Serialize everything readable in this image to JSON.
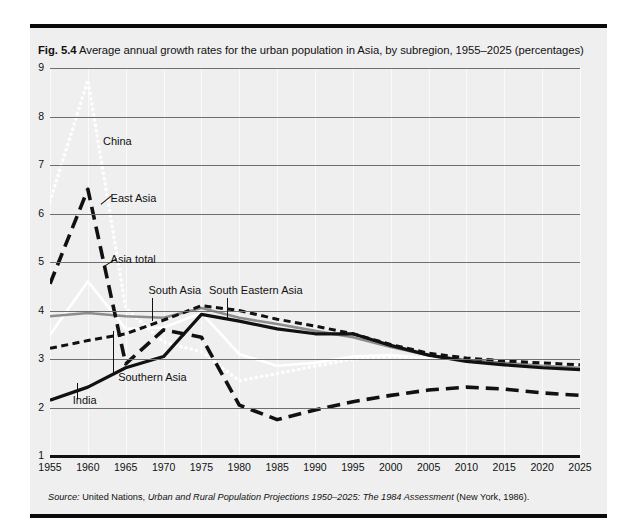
{
  "figure": {
    "number": "Fig. 5.4",
    "caption": "Average annual growth rates for the urban population in Asia, by subregion, 1955–2025 (percentages)",
    "source_label": "Source:",
    "source_org": "United Nations,",
    "source_title": "Urban and Rural Population Projections 1950–2025: The 1984 Assessment",
    "source_pub": "(New York, 1986)."
  },
  "chart_data": {
    "type": "line",
    "title": "Average annual growth rates for the urban population in Asia, by subregion, 1955–2025 (percentages)",
    "xlabel": "",
    "ylabel": "",
    "xlim": [
      1955,
      2025
    ],
    "ylim": [
      1,
      9
    ],
    "grid": true,
    "legend": "in-chart annotations",
    "x": [
      1955,
      1960,
      1965,
      1970,
      1975,
      1980,
      1985,
      1990,
      1995,
      2000,
      2005,
      2010,
      2015,
      2020,
      2025
    ],
    "xticklabels": [
      "1955",
      "1960",
      "1965",
      "1970",
      "1975",
      "1980",
      "1985",
      "1990",
      "1995",
      "2000",
      "2005",
      "2010",
      "2015",
      "2020",
      "2025"
    ],
    "yticks": [
      1,
      2,
      3,
      4,
      5,
      6,
      7,
      8,
      9
    ],
    "yticklabels": [
      "1",
      "2",
      "3",
      "4",
      "5",
      "6",
      "7",
      "8",
      "9"
    ],
    "series": [
      {
        "name": "China",
        "style": "dotted",
        "color": "#ffffff",
        "values": [
          6.25,
          8.75,
          4.05,
          3.35,
          3.15,
          2.55,
          2.7,
          2.85,
          3.0,
          3.05,
          3.02,
          2.98,
          2.95,
          2.9,
          2.86
        ]
      },
      {
        "name": "East Asia",
        "style": "long-dash",
        "color": "#111111",
        "values": [
          4.55,
          6.5,
          2.9,
          3.6,
          3.45,
          2.05,
          1.75,
          1.95,
          2.12,
          2.25,
          2.36,
          2.42,
          2.38,
          2.3,
          2.25
        ]
      },
      {
        "name": "Asia total",
        "style": "solid-gray",
        "color": "#8d8d8d",
        "values": [
          3.88,
          3.95,
          3.88,
          3.85,
          4.05,
          3.85,
          3.72,
          3.58,
          3.45,
          3.25,
          3.08,
          2.98,
          2.92,
          2.86,
          2.82
        ]
      },
      {
        "name": "South Asia",
        "style": "short-dash",
        "color": "#111111",
        "values": [
          3.22,
          3.38,
          3.52,
          3.8,
          4.1,
          4.0,
          3.82,
          3.68,
          3.52,
          3.3,
          3.12,
          3.02,
          2.96,
          2.92,
          2.88
        ]
      },
      {
        "name": "Southern Asia",
        "style": "solid-white",
        "color": "#ffffff",
        "values": [
          3.5,
          4.6,
          3.62,
          3.65,
          3.95,
          3.1,
          2.86,
          2.92,
          3.05,
          3.08,
          3.02,
          2.98,
          2.94,
          2.9,
          2.86
        ]
      },
      {
        "name": "India",
        "style": "solid-black",
        "color": "#111111",
        "values": [
          2.15,
          2.42,
          2.82,
          3.05,
          3.92,
          3.78,
          3.62,
          3.52,
          3.52,
          3.28,
          3.08,
          2.95,
          2.88,
          2.82,
          2.78
        ]
      }
    ],
    "annotations": [
      {
        "text": "China",
        "x": 1962,
        "y": 7.45,
        "leader": false
      },
      {
        "text": "East Asia",
        "x": 1963,
        "y": 6.28,
        "leader": true
      },
      {
        "text": "Asia total",
        "x": 1963,
        "y": 5.02,
        "leader": true
      },
      {
        "text": "South Asia",
        "x": 1968,
        "y": 4.38,
        "leader": true
      },
      {
        "text": "South Eastern Asia",
        "x": 1976,
        "y": 4.38,
        "leader": true
      },
      {
        "text": "Southern Asia",
        "x": 1964,
        "y": 2.58,
        "leader": true
      },
      {
        "text": "India",
        "x": 1958,
        "y": 2.12,
        "leader": true
      }
    ]
  }
}
